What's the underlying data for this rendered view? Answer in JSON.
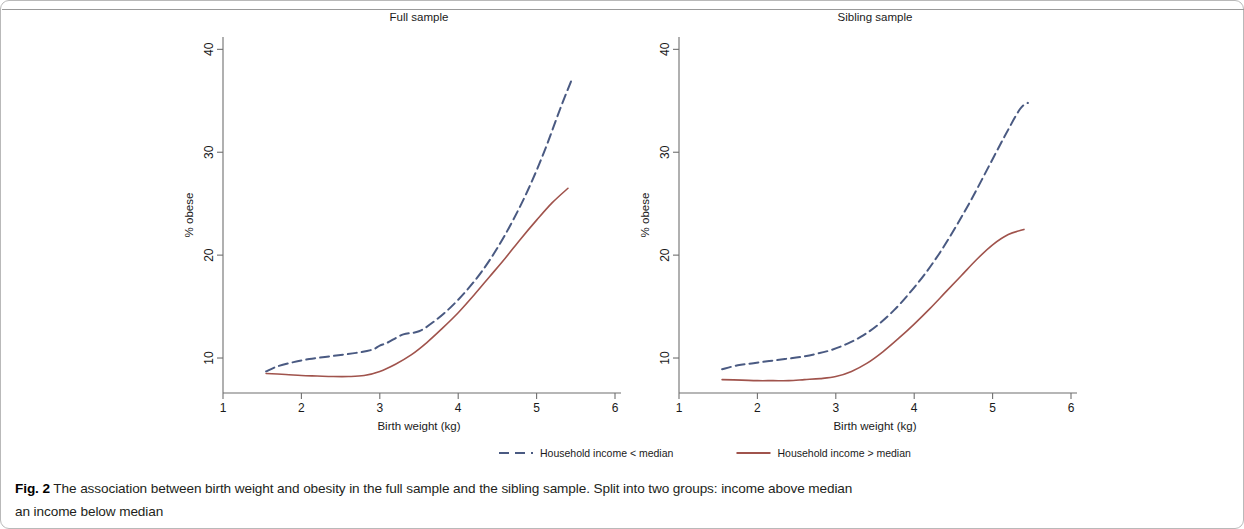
{
  "figure": {
    "label": "Fig. 2",
    "caption_line1": "The association between birth weight and obesity in the full sample and the sibling sample. Split into two groups: income above median",
    "caption_line2": "an income below median"
  },
  "legend": {
    "position": "bottom-center",
    "items": [
      {
        "label": "Household income < median",
        "color": "#4a5a82",
        "dash": "dashed"
      },
      {
        "label": "Household income > median",
        "color": "#a0534c",
        "dash": "solid"
      }
    ]
  },
  "chart_data": [
    {
      "type": "line",
      "title": "Full sample",
      "xlabel": "Birth weight (kg)",
      "ylabel": "% obese",
      "xlim": [
        1,
        6
      ],
      "ylim": [
        6.6,
        41.2
      ],
      "xticks": [
        1,
        2,
        3,
        4,
        5,
        6
      ],
      "yticks": [
        10,
        20,
        30,
        40
      ],
      "grid": false,
      "series": [
        {
          "name": "Household income < median",
          "color": "#4a5a82",
          "dash": "dashed",
          "x": [
            1.55,
            1.7,
            1.9,
            2.1,
            2.3,
            2.5,
            2.7,
            2.9,
            3.0,
            3.1,
            3.3,
            3.5,
            3.7,
            3.9,
            4.1,
            4.3,
            4.5,
            4.7,
            4.9,
            5.1,
            5.3,
            5.45
          ],
          "y": [
            8.7,
            9.2,
            9.6,
            9.9,
            10.1,
            10.3,
            10.5,
            10.8,
            11.2,
            11.5,
            12.3,
            12.6,
            13.6,
            14.9,
            16.5,
            18.4,
            20.7,
            23.4,
            26.5,
            30.1,
            34.2,
            37.1
          ]
        },
        {
          "name": "Household income > median",
          "color": "#a0534c",
          "dash": "solid",
          "x": [
            1.55,
            1.8,
            2.0,
            2.2,
            2.4,
            2.6,
            2.8,
            3.0,
            3.2,
            3.4,
            3.6,
            3.8,
            4.0,
            4.2,
            4.4,
            4.6,
            4.8,
            5.0,
            5.2,
            5.4
          ],
          "y": [
            8.5,
            8.4,
            8.3,
            8.25,
            8.2,
            8.2,
            8.3,
            8.7,
            9.4,
            10.3,
            11.5,
            12.9,
            14.4,
            16.1,
            17.9,
            19.7,
            21.6,
            23.4,
            25.1,
            26.5
          ]
        }
      ]
    },
    {
      "type": "line",
      "title": "Sibling sample",
      "xlabel": "Birth weight (kg)",
      "ylabel": "% obese",
      "xlim": [
        1,
        6
      ],
      "ylim": [
        6.6,
        41.2
      ],
      "xticks": [
        1,
        2,
        3,
        4,
        5,
        6
      ],
      "yticks": [
        10,
        20,
        30,
        40
      ],
      "grid": false,
      "series": [
        {
          "name": "Household income < median",
          "color": "#4a5a82",
          "dash": "dashed",
          "x": [
            1.55,
            1.75,
            1.95,
            2.15,
            2.35,
            2.55,
            2.75,
            2.95,
            3.15,
            3.35,
            3.55,
            3.75,
            3.95,
            4.15,
            4.35,
            4.55,
            4.75,
            4.95,
            5.15,
            5.35,
            5.45
          ],
          "y": [
            8.9,
            9.3,
            9.5,
            9.7,
            9.9,
            10.1,
            10.4,
            10.8,
            11.4,
            12.2,
            13.3,
            14.7,
            16.4,
            18.3,
            20.5,
            23.0,
            25.7,
            28.6,
            31.5,
            34.2,
            34.8
          ]
        },
        {
          "name": "Household income > median",
          "color": "#a0534c",
          "dash": "solid",
          "x": [
            1.55,
            1.8,
            2.0,
            2.2,
            2.4,
            2.6,
            2.8,
            3.0,
            3.2,
            3.4,
            3.6,
            3.8,
            4.0,
            4.2,
            4.4,
            4.6,
            4.8,
            5.0,
            5.2,
            5.4
          ],
          "y": [
            7.9,
            7.85,
            7.8,
            7.8,
            7.8,
            7.9,
            8.0,
            8.2,
            8.7,
            9.5,
            10.6,
            11.9,
            13.3,
            14.8,
            16.4,
            18.0,
            19.6,
            21.0,
            22.0,
            22.5
          ]
        }
      ]
    }
  ]
}
